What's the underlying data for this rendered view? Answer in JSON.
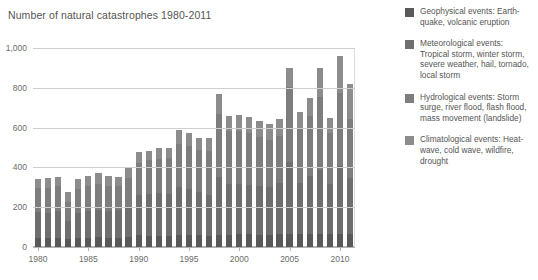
{
  "chart_data": {
    "type": "bar",
    "stacked": true,
    "title": "Number of natural catastrophes 1980-2011",
    "xlabel": "",
    "ylabel": "",
    "ylim": [
      0,
      1000
    ],
    "ytick_labels": [
      "0",
      "200",
      "400",
      "600",
      "800",
      "1,000"
    ],
    "ytick_values": [
      0,
      200,
      400,
      600,
      800,
      1000
    ],
    "grid": true,
    "legend_position": "right",
    "categories": [
      "1980",
      "1981",
      "1982",
      "1983",
      "1984",
      "1985",
      "1986",
      "1987",
      "1988",
      "1989",
      "1990",
      "1991",
      "1992",
      "1993",
      "1994",
      "1995",
      "1996",
      "1997",
      "1998",
      "1999",
      "2000",
      "2001",
      "2002",
      "2003",
      "2004",
      "2005",
      "2006",
      "2007",
      "2008",
      "2009",
      "2010",
      "2011"
    ],
    "xtick_labels": [
      "1980",
      "1985",
      "1990",
      "1995",
      "2000",
      "2005",
      "2010"
    ],
    "xtick_categories": [
      "1980",
      "1985",
      "1990",
      "1995",
      "2000",
      "2005",
      "2010"
    ],
    "series": [
      {
        "name": "Geophysical events",
        "color": "#595959",
        "values": [
          45,
          45,
          45,
          38,
          45,
          45,
          48,
          45,
          45,
          48,
          60,
          55,
          55,
          55,
          60,
          60,
          60,
          55,
          60,
          60,
          65,
          65,
          60,
          60,
          65,
          65,
          65,
          65,
          65,
          65,
          65,
          65
        ]
      },
      {
        "name": "Meteorological events",
        "color": "#6e6e6e",
        "values": [
          130,
          125,
          135,
          95,
          125,
          135,
          140,
          135,
          140,
          155,
          200,
          210,
          215,
          210,
          240,
          230,
          215,
          205,
          290,
          255,
          250,
          245,
          245,
          240,
          255,
          360,
          255,
          290,
          320,
          250,
          340,
          280
        ]
      },
      {
        "name": "Hydrological events",
        "color": "#7d7d7d",
        "values": [
          120,
          125,
          125,
          95,
          120,
          125,
          130,
          125,
          120,
          145,
          160,
          170,
          170,
          180,
          220,
          220,
          215,
          225,
          320,
          270,
          270,
          265,
          250,
          240,
          240,
          380,
          280,
          305,
          370,
          260,
          370,
          300
        ]
      },
      {
        "name": "Climatological events",
        "color": "#8c8c8c",
        "values": [
          45,
          50,
          45,
          47,
          50,
          50,
          52,
          50,
          45,
          52,
          60,
          50,
          60,
          55,
          70,
          65,
          60,
          65,
          100,
          75,
          80,
          80,
          80,
          80,
          85,
          95,
          80,
          90,
          145,
          75,
          185,
          175
        ]
      }
    ],
    "totals": [
      340,
      345,
      350,
      275,
      340,
      355,
      370,
      355,
      350,
      400,
      480,
      485,
      500,
      500,
      590,
      575,
      550,
      550,
      770,
      660,
      665,
      655,
      635,
      620,
      645,
      900,
      680,
      750,
      900,
      650,
      960,
      820
    ],
    "source_note": ""
  },
  "legend": {
    "items": [
      {
        "label": "Geophysical events: Earth-quake, volcanic eruption",
        "text": "Geophysical events: Earth-\nquake, volcanic eruption",
        "color": "#595959"
      },
      {
        "label": "Meteorological events: Tropical storm, winter storm, severe weather, hail, tornado, local storm",
        "text": "Meteorological events:\nTropical storm, winter storm,\nsevere weather, hail, tornado,\nlocal storm",
        "color": "#6e6e6e"
      },
      {
        "label": "Hydrological events: Storm surge, river flood, flash flood, mass movement (landslide)",
        "text": "Hydrological events: Storm\nsurge, river flood, flash flood,\nmass movement (landslide)",
        "color": "#7d7d7d"
      },
      {
        "label": "Climatological events: Heat-wave, cold wave, wildfire, drought",
        "text": "Climatological events: Heat-\nwave, cold wave, wildfire,\ndrought",
        "color": "#8c8c8c"
      }
    ]
  },
  "colors": {
    "background": "#ffffff",
    "text": "#555555",
    "grid": "#cfcfcf",
    "axis": "#b3b3b3"
  }
}
